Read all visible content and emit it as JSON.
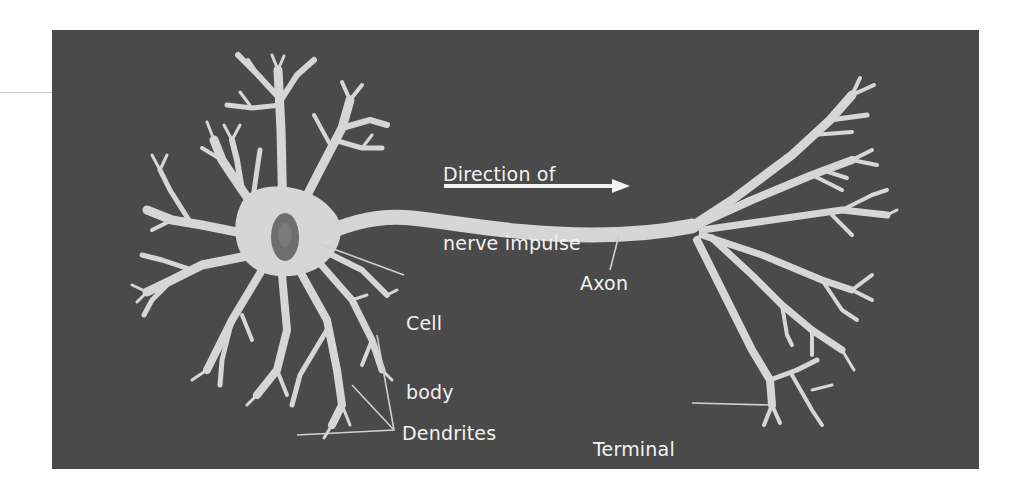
{
  "diagram": {
    "colors": {
      "background": "#4a4a4a",
      "neuron": "#d6d6d6",
      "neuron_edge": "#bdbdbd",
      "nucleus": "#6e6e6e",
      "text": "#f2f2f2",
      "leader": "#cfcfcf"
    },
    "labels": {
      "direction_line1": "Direction of",
      "direction_line2": "nerve impulse",
      "cell_body_line1": "Cell",
      "cell_body_line2": "body",
      "axon": "Axon",
      "dendrites": "Dendrites",
      "terminal_line1": "Terminal",
      "terminal_line2": "buttons"
    },
    "arrow": {
      "direction": "right",
      "description": "Direction of nerve impulse arrow"
    },
    "parts": [
      "Cell body",
      "Nucleus",
      "Dendrites",
      "Axon",
      "Terminal buttons"
    ]
  }
}
